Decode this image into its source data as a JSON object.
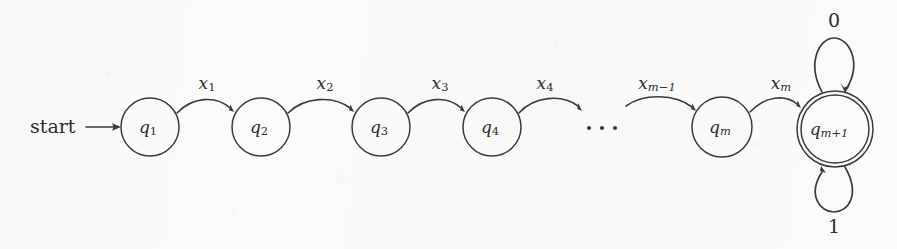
{
  "figure": {
    "kind": "finite-state-automaton-diagram",
    "background_color": "#fbfbfb",
    "ink_color": "#3b3b3b",
    "start_marker": {
      "label": "start",
      "arrow": "→",
      "target_state": "q1"
    },
    "states": [
      {
        "id": "q1",
        "base": "q",
        "sub": "1",
        "sub_italic": false,
        "accepting": false,
        "cx": 150,
        "cy": 127,
        "r": 29
      },
      {
        "id": "q2",
        "base": "q",
        "sub": "2",
        "sub_italic": false,
        "accepting": false,
        "cx": 261,
        "cy": 127,
        "r": 29
      },
      {
        "id": "q3",
        "base": "q",
        "sub": "3",
        "sub_italic": false,
        "accepting": false,
        "cx": 381,
        "cy": 127,
        "r": 29
      },
      {
        "id": "q4",
        "base": "q",
        "sub": "4",
        "sub_italic": false,
        "accepting": false,
        "cx": 492,
        "cy": 127,
        "r": 29
      },
      {
        "id": "qm",
        "base": "q",
        "sub": "m",
        "sub_italic": true,
        "accepting": false,
        "cx": 722,
        "cy": 127,
        "r": 30
      },
      {
        "id": "qm1",
        "base": "q",
        "sub": "m+1",
        "sub_italic": true,
        "accepting": true,
        "cx": 835,
        "cy": 129,
        "r": 38
      }
    ],
    "ellipsis": {
      "symbol": "...",
      "dot_count": 3,
      "cx": 602,
      "cy": 127
    },
    "transitions": [
      {
        "from": "q1",
        "to": "q2",
        "base": "x",
        "sub": "1",
        "sub_italic": false,
        "label_x": 207,
        "label_y": 84
      },
      {
        "from": "q2",
        "to": "q3",
        "base": "x",
        "sub": "2",
        "sub_italic": false,
        "label_x": 325,
        "label_y": 84
      },
      {
        "from": "q3",
        "to": "q4",
        "base": "x",
        "sub": "3",
        "sub_italic": false,
        "label_x": 440,
        "label_y": 84
      },
      {
        "from": "q4",
        "to": "dots",
        "base": "x",
        "sub": "4",
        "sub_italic": false,
        "label_x": 545,
        "label_y": 84
      },
      {
        "from": "dots",
        "to": "qm",
        "base": "x",
        "sub": "m−1",
        "sub_italic": true,
        "label_x": 657,
        "label_y": 84
      },
      {
        "from": "qm",
        "to": "qm1",
        "base": "x",
        "sub": "m",
        "sub_italic": true,
        "label_x": 781,
        "label_y": 84
      }
    ],
    "self_loops": [
      {
        "state": "qm1",
        "label": "0",
        "position": "top",
        "label_x": 834,
        "label_y": 22
      },
      {
        "state": "qm1",
        "label": "1",
        "position": "bottom",
        "label_x": 834,
        "label_y": 228
      }
    ]
  }
}
